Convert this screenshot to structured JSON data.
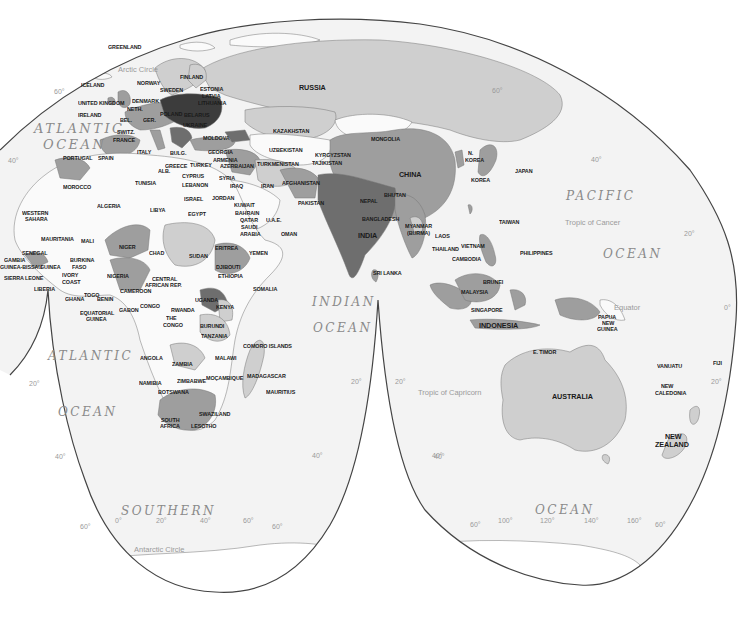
{
  "colors": {
    "ocean": "#f3f3f3",
    "outline": "#444444",
    "land_white": "#fafafa",
    "land_light": "#cfcfcf",
    "land_mid": "#9e9e9e",
    "land_dark": "#6e6e6e",
    "land_darkest": "#3c3c3c",
    "graticule_text": "#9a9a9a",
    "ocean_text": "#8a8a8a"
  },
  "oceans": {
    "atlantic_north_1": "ATLANTIC",
    "atlantic_north_2": "OCEAN",
    "atlantic_south_1": "ATLANTIC",
    "atlantic_south_2": "OCEAN",
    "indian_1": "INDIAN",
    "indian_2": "OCEAN",
    "pacific_1": "PACIFIC",
    "pacific_2": "OCEAN",
    "southern_1": "SOUTHERN",
    "southern_2": "OCEAN"
  },
  "reference_lines": {
    "arctic_circle": "Arctic Circle",
    "tropic_cancer": "Tropic of Cancer",
    "equator": "Equator",
    "tropic_capricorn": "Tropic of Capricorn",
    "antarctic_circle": "Antarctic Circle"
  },
  "graticule": {
    "lat_60n_w": "60°",
    "lat_40n_w": "40°",
    "lat_20s_w": "20°",
    "lat_40s_w": "40°",
    "lat_60n_e": "60°",
    "lat_40n_e": "40°",
    "lat_20n_e": "20°",
    "lat_0_e": "0°",
    "lat_20s_e": "20°",
    "lat_20s_mid_l": "20°",
    "lat_20s_mid_r": "20°",
    "lat_40s_mid_l": "40°",
    "lat_40s_mid_r": "40°",
    "lat_40s_l": "40°",
    "lat_40s_r": "40°",
    "lon_row1": [
      "60°",
      "0°",
      "20°",
      "40°",
      "60°",
      "60°"
    ],
    "lon_row2": [
      "60°",
      "100°",
      "120°",
      "140°",
      "160°",
      "60°"
    ]
  },
  "countries": {
    "greenland": "GREENLAND",
    "iceland": "ICELAND",
    "norway": "NORWAY",
    "sweden": "SWEDEN",
    "finland": "FINLAND",
    "estonia": "ESTONIA",
    "latvia": "LATVIA",
    "lithuania": "LITHUANIA",
    "denmark": "DENMARK",
    "united_kingdom": "UNITED KINGDOM",
    "ireland": "IRELAND",
    "neth": "NETH.",
    "bel": "BEL.",
    "ger": "GER.",
    "poland": "POLAND",
    "belarus": "BELARUS",
    "ukraine": "UKRAINE",
    "switz": "SWITZ.",
    "france": "FRANCE",
    "moldova": "MOLDOVA",
    "portugal": "PORTUGAL",
    "spain": "SPAIN",
    "italy": "ITALY",
    "alb": "ALB.",
    "greece": "GREECE",
    "bulg": "BULG.",
    "turkey": "TURKEY",
    "georgia": "GEORGIA",
    "armenia": "ARMENIA",
    "azerbaijan": "AZERBAIJAN",
    "cyprus": "CYPRUS",
    "lebanon": "LEBANON",
    "syria": "SYRIA",
    "iraq": "IRAQ",
    "israel": "ISRAEL",
    "jordan": "JORDAN",
    "kuwait": "KUWAIT",
    "bahrain": "BAHRAIN",
    "qatar": "QATAR",
    "uae": "U.A.E.",
    "saudi_arabia_1": "SAUDI",
    "saudi_arabia_2": "ARABIA",
    "oman": "OMAN",
    "yemen": "YEMEN",
    "iran": "IRAN",
    "russia": "RUSSIA",
    "kazakhstan": "KAZAKHSTAN",
    "uzbekistan": "UZBEKISTAN",
    "turkmenistan": "TURKMENISTAN",
    "kyrgyzstan": "KYRGYZSTAN",
    "tajikistan": "TAJIKISTAN",
    "afghanistan": "AFGHANISTAN",
    "pakistan": "PAKISTAN",
    "india": "INDIA",
    "nepal": "NEPAL",
    "bhutan": "BHUTAN",
    "bangladesh": "BANGLADESH",
    "sri_lanka": "SRI LANKA",
    "mongolia": "MONGOLIA",
    "china": "CHINA",
    "n_korea_1": "N.",
    "n_korea_2": "KOREA",
    "s_korea": "KOREA",
    "japan": "JAPAN",
    "taiwan": "TAIWAN",
    "myanmar_1": "MYANMAR",
    "myanmar_2": "(BURMA)",
    "laos": "LAOS",
    "thailand": "THAILAND",
    "vietnam": "VIETNAM",
    "cambodia": "CAMBODIA",
    "philippines": "PHILIPPINES",
    "brunei": "BRUNEI",
    "malaysia": "MALAYSIA",
    "singapore": "SINGAPORE",
    "indonesia": "INDONESIA",
    "e_timor": "E. TIMOR",
    "papua_1": "PAPUA",
    "papua_2": "NEW",
    "papua_3": "GUINEA",
    "australia": "AUSTRALIA",
    "vanuatu": "VANUATU",
    "fiji": "FIJI",
    "new_caledonia_1": "NEW",
    "new_caledonia_2": "CALEDONIA",
    "new_zealand_1": "NEW",
    "new_zealand_2": "ZEALAND",
    "morocco": "MOROCCO",
    "algeria": "ALGERIA",
    "tunisia": "TUNISIA",
    "libya": "LIBYA",
    "egypt": "EGYPT",
    "western_sahara_1": "WESTERN",
    "western_sahara_2": "SAHARA",
    "mauritania": "MAURITANIA",
    "mali": "MALI",
    "niger": "NIGER",
    "chad": "CHAD",
    "sudan": "SUDAN",
    "eritrea": "ERITREA",
    "djibouti": "DJIBOUTI",
    "ethiopia": "ETHIOPIA",
    "somalia": "SOMALIA",
    "senegal": "SENEGAL",
    "gambia": "GAMBIA",
    "guinea_bissau": "GUINEA-BISSAU",
    "guinea": "GUINEA",
    "sierra_leone": "SIERRA LEONE",
    "liberia": "LIBERIA",
    "ivory_coast_1": "IVORY",
    "ivory_coast_2": "COAST",
    "burkina_1": "BURKINA",
    "burkina_2": "FASO",
    "ghana": "GHANA",
    "togo": "TOGO",
    "benin": "BENIN",
    "nigeria": "NIGERIA",
    "cameroon": "CAMEROON",
    "car_1": "CENTRAL",
    "car_2": "AFRICAN REP.",
    "eq_guinea_1": "EQUATORIAL",
    "eq_guinea_2": "GUINEA",
    "gabon": "GABON",
    "congo": "CONGO",
    "drc_1": "THE",
    "drc_2": "CONGO",
    "uganda": "UGANDA",
    "kenya": "KENYA",
    "rwanda": "RWANDA",
    "burundi": "BURUNDI",
    "tanzania": "TANZANIA",
    "comoro": "COMORO ISLANDS",
    "angola": "ANGOLA",
    "zambia": "ZAMBIA",
    "malawi": "MALAWI",
    "mozambique": "MOÇAMBIQUE",
    "madagascar": "MADAGASCAR",
    "mauritius": "MAURITIUS",
    "namibia": "NAMIBIA",
    "zimbabwe": "ZIMBABWE",
    "botswana": "BOTSWANA",
    "swaziland": "SWAZILAND",
    "south_africa_1": "SOUTH",
    "south_africa_2": "AFRICA",
    "lesotho": "LESOTHO"
  }
}
